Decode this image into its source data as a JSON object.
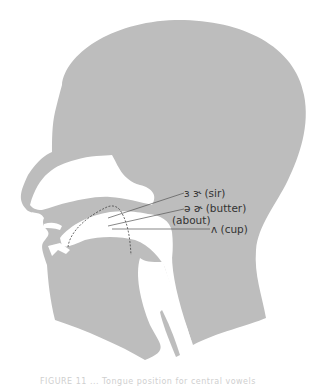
{
  "figure": {
    "type": "sagittal head cross-section diagram",
    "fill_color": "#bdbdbd",
    "line_color": "#555555",
    "labels": [
      {
        "id": "sir",
        "symbols": "ɜ  ɝ",
        "text": "ɜ   ɝ (sir)"
      },
      {
        "id": "butter",
        "symbols": "ə  ɚ",
        "text": "ə   ɚ (butter)"
      },
      {
        "id": "about",
        "text": "(about)"
      },
      {
        "id": "cup",
        "symbols": "ʌ",
        "text": "ʌ (cup)"
      }
    ],
    "caption": "FIGURE 11 ... Tongue position for central vowels"
  }
}
